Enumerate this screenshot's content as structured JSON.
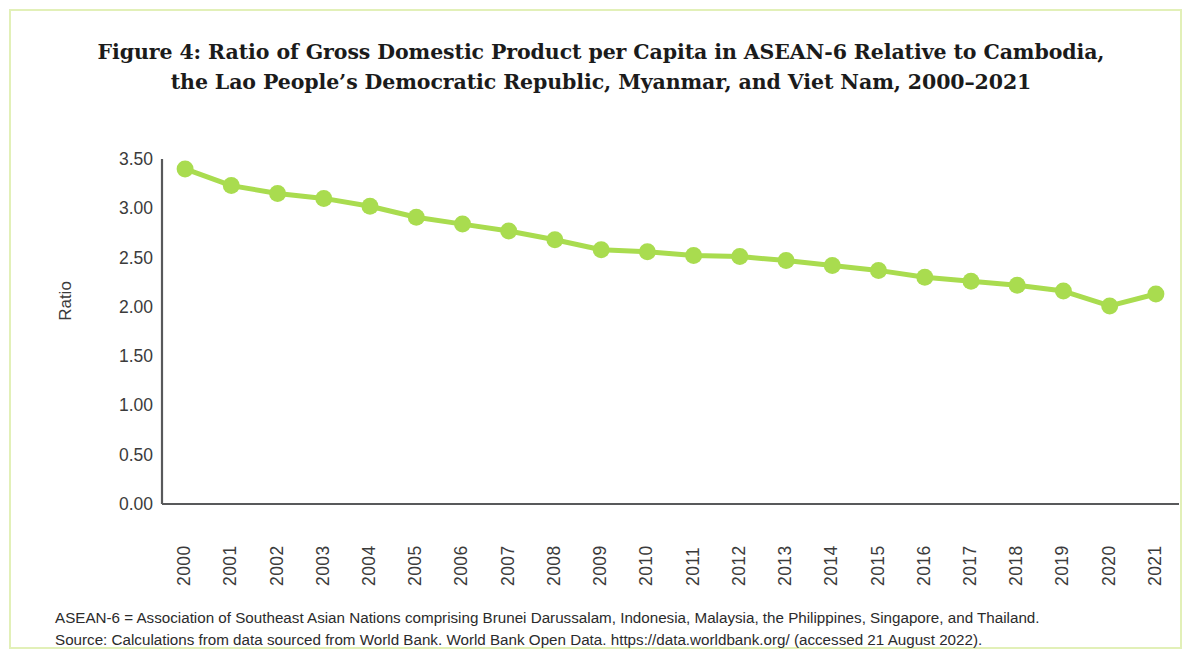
{
  "figure": {
    "title_line1": "Figure 4: Ratio of Gross Domestic Product per Capita in ASEAN-6 Relative to Cambodia,",
    "title_line2": "the Lao People’s Democratic Republic, Myanmar, and Viet Nam, 2000–2021",
    "note": "ASEAN-6 = Association of Southeast Asian Nations comprising Brunei Darussalam, Indonesia, Malaysia, the Philippines, Singapore, and Thailand.",
    "source": "Source: Calculations from data sourced from World Bank. World Bank Open Data. https://data.worldbank.org/ (accessed 21 August 2022).",
    "accent_color": "#a9dc4f",
    "frame_color": "#e2f0b8",
    "axis_color": "#58595b"
  },
  "chart_data": {
    "type": "line",
    "title": "Figure 4: Ratio of Gross Domestic Product per Capita in ASEAN-6 Relative to Cambodia, the Lao People’s Democratic Republic, Myanmar, and Viet Nam, 2000–2021",
    "xlabel": "",
    "ylabel": "Ratio",
    "x": [
      "2000",
      "2001",
      "2002",
      "2003",
      "2004",
      "2005",
      "2006",
      "2007",
      "2008",
      "2009",
      "2010",
      "2011",
      "2012",
      "2013",
      "2014",
      "2015",
      "2016",
      "2017",
      "2018",
      "2019",
      "2020",
      "2021"
    ],
    "values": [
      3.4,
      3.23,
      3.15,
      3.1,
      3.02,
      2.91,
      2.84,
      2.77,
      2.68,
      2.58,
      2.56,
      2.52,
      2.51,
      2.47,
      2.42,
      2.37,
      2.3,
      2.26,
      2.22,
      2.16,
      2.01,
      2.13
    ],
    "series": [
      {
        "name": "Ratio of GDP per capita, ASEAN-6 relative to CLMV",
        "values": [
          3.4,
          3.23,
          3.15,
          3.1,
          3.02,
          2.91,
          2.84,
          2.77,
          2.68,
          2.58,
          2.56,
          2.52,
          2.51,
          2.47,
          2.42,
          2.37,
          2.3,
          2.26,
          2.22,
          2.16,
          2.01,
          2.13
        ],
        "color": "#a9dc4f"
      }
    ],
    "ylim": [
      0.0,
      3.5
    ],
    "yticks": [
      "0.00",
      "0.50",
      "1.00",
      "1.50",
      "2.00",
      "2.50",
      "3.00",
      "3.50"
    ],
    "ytick_values": [
      0.0,
      0.5,
      1.0,
      1.5,
      2.0,
      2.5,
      3.0,
      3.5
    ],
    "grid": false,
    "legend": "none",
    "marker": "circle"
  }
}
